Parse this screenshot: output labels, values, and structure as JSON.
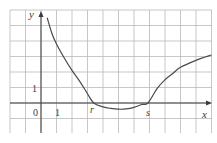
{
  "chart_data": {
    "type": "line",
    "title": "",
    "xlabel": "x",
    "ylabel": "y",
    "xlim": [
      -2,
      11
    ],
    "ylim": [
      -2,
      6
    ],
    "grid": true,
    "tick_labels": {
      "origin": "0",
      "x_one": "1",
      "y_one": "1"
    },
    "annotations": [
      {
        "text": "r",
        "x": 3.4,
        "y": 0,
        "meaning": "first x-intercept"
      },
      {
        "text": "s",
        "x": 6.9,
        "y": 0,
        "meaning": "second x-intercept"
      }
    ],
    "series": [
      {
        "name": "f(x)",
        "x": [
          0.4,
          0.7,
          1.0,
          1.5,
          2.0,
          2.5,
          3.0,
          3.4,
          4.0,
          4.5,
          5.0,
          5.5,
          6.0,
          6.5,
          6.9,
          7.5,
          8.0,
          8.5,
          9.0,
          10.0,
          11.0
        ],
        "y": [
          5.5,
          4.5,
          3.8,
          2.9,
          2.1,
          1.4,
          0.6,
          0.0,
          -0.25,
          -0.35,
          -0.4,
          -0.38,
          -0.28,
          -0.1,
          0.0,
          0.95,
          1.5,
          1.9,
          2.3,
          2.75,
          3.1
        ]
      }
    ]
  },
  "colors": {
    "grid": "#b9b9b9",
    "axes": "#3a3a3a",
    "curve": "#4a4a4a",
    "background": "#ffffff"
  }
}
